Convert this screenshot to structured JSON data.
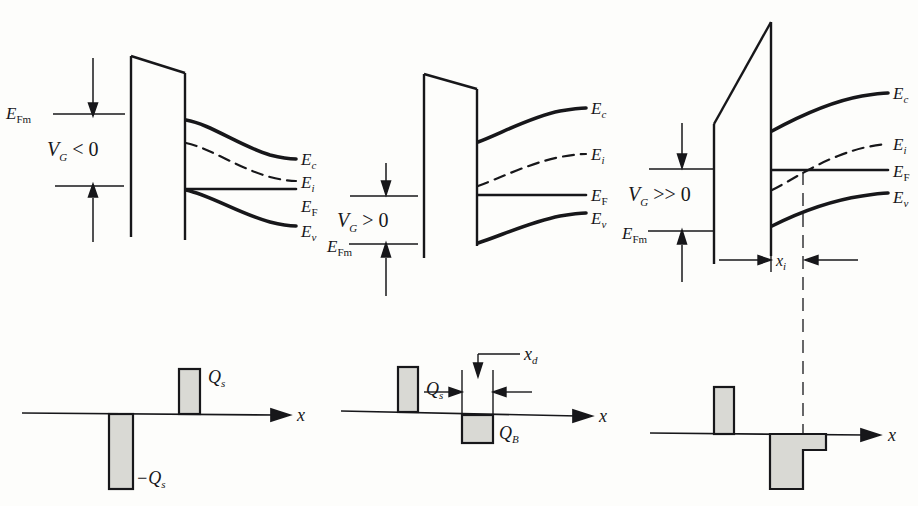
{
  "figure": {
    "type": "diagram",
    "axis_label": "x"
  },
  "panels": [
    {
      "id": "accumulation",
      "bias_label": "V",
      "bias_sub": "G",
      "bias_rel": "< 0",
      "metal_fermi_label": "E",
      "metal_fermi_sub": "Fm",
      "bands": [
        {
          "name": "E",
          "sub": "c",
          "style": "solid"
        },
        {
          "name": "E",
          "sub": "i",
          "style": "dashed"
        },
        {
          "name": "E",
          "sub": "F",
          "style": "solid"
        },
        {
          "name": "E",
          "sub": "v",
          "style": "solid"
        }
      ],
      "charge": {
        "positive_label": "Q",
        "positive_sub": "s",
        "negative_label": "−Q",
        "negative_sub": "s",
        "axis_label": "x"
      }
    },
    {
      "id": "depletion",
      "bias_label": "V",
      "bias_sub": "G",
      "bias_rel": "> 0",
      "metal_fermi_label": "E",
      "metal_fermi_sub": "Fm",
      "bands": [
        {
          "name": "E",
          "sub": "c",
          "style": "solid"
        },
        {
          "name": "E",
          "sub": "i",
          "style": "dashed"
        },
        {
          "name": "E",
          "sub": "F",
          "style": "solid"
        },
        {
          "name": "E",
          "sub": "v",
          "style": "solid"
        }
      ],
      "charge": {
        "positive_label": "Q",
        "positive_sub": "s",
        "negative_label": "Q",
        "negative_sub": "B",
        "width_label": "x",
        "width_sub": "d",
        "axis_label": "x"
      }
    },
    {
      "id": "inversion",
      "bias_label": "V",
      "bias_sub": "G",
      "bias_rel": ">> 0",
      "metal_fermi_label": "E",
      "metal_fermi_sub": "Fm",
      "inversion_width_label": "x",
      "inversion_width_sub": "i",
      "bands": [
        {
          "name": "E",
          "sub": "c",
          "style": "solid"
        },
        {
          "name": "E",
          "sub": "i",
          "style": "dashed"
        },
        {
          "name": "E",
          "sub": "F",
          "style": "solid"
        },
        {
          "name": "E",
          "sub": "v",
          "style": "solid"
        }
      ],
      "charge": {
        "axis_label": "x"
      }
    }
  ],
  "colors": {
    "ink": "#17171a",
    "bar_fill": "#d9d9d4",
    "bar_stroke": "#17171a",
    "background": "#fdfdfb"
  }
}
